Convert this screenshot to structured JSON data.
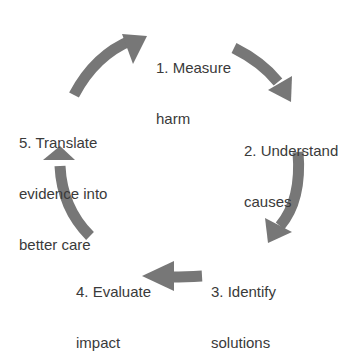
{
  "diagram": {
    "type": "cycle",
    "arrow_color": "#777777",
    "text_color": "#3a3a3a",
    "steps": [
      {
        "number": 1,
        "lines": [
          "1. Measure",
          "harm"
        ]
      },
      {
        "number": 2,
        "lines": [
          "2. Understand",
          "causes"
        ]
      },
      {
        "number": 3,
        "lines": [
          "3. Identify",
          "solutions"
        ]
      },
      {
        "number": 4,
        "lines": [
          "4. Evaluate",
          "impact"
        ]
      },
      {
        "number": 5,
        "lines": [
          "5. Translate",
          "evidence into",
          "better care"
        ]
      }
    ]
  }
}
